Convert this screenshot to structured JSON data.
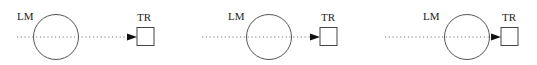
{
  "diagram": {
    "panels": [
      {
        "id": "panel-1",
        "circle_label": "LM",
        "square_label": "TR",
        "line_start_x": 17,
        "circle": {
          "cx": 56,
          "cy": 37,
          "r": 22.5
        },
        "label_lm": {
          "x": 17,
          "y": 20
        },
        "square": {
          "x": 137,
          "y": 27.5,
          "w": 17,
          "h": 18
        },
        "label_tr": {
          "x": 137,
          "y": 21
        }
      },
      {
        "id": "panel-2",
        "circle_label": "LM",
        "square_label": "TR",
        "line_start_x": 202,
        "circle": {
          "cx": 269,
          "cy": 37,
          "r": 22.5
        },
        "label_lm": {
          "x": 228,
          "y": 20
        },
        "square": {
          "x": 320,
          "y": 27.5,
          "w": 17,
          "h": 18
        },
        "label_tr": {
          "x": 321,
          "y": 21
        }
      },
      {
        "id": "panel-3",
        "circle_label": "LM",
        "square_label": "TR",
        "line_start_x": 385,
        "circle": {
          "cx": 467,
          "cy": 37,
          "r": 22.5
        },
        "label_lm": {
          "x": 423,
          "y": 20
        },
        "square": {
          "x": 501,
          "y": 27.5,
          "w": 17,
          "h": 18
        },
        "label_tr": {
          "x": 502,
          "y": 21
        }
      }
    ],
    "colors": {
      "stroke": "#555555",
      "dotted_line": "#777777",
      "arrowhead": "#111111",
      "text": "#222222"
    }
  }
}
